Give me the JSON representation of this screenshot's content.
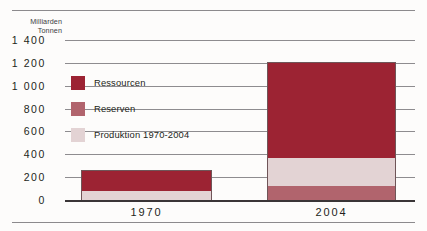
{
  "chart_data": {
    "type": "bar",
    "title": "",
    "subtitle": "",
    "stacked": true,
    "xlabel": "",
    "ylabel": "Milliarden\nTonnen",
    "ylim": [
      0,
      1400
    ],
    "ytick_step": 200,
    "yticks": [
      "0",
      "200",
      "400",
      "600",
      "800",
      "1 000",
      "1 200",
      "1 400"
    ],
    "ytick_values": [
      0,
      200,
      400,
      600,
      800,
      1000,
      1200,
      1400
    ],
    "categories": [
      "1970",
      "2004"
    ],
    "grid": "horizontal",
    "legend_position": "inside-upper-left",
    "series": [
      {
        "name": "Produktion 1970-2004",
        "color": "#e3d3d4",
        "values": [
          80,
          245
        ]
      },
      {
        "name": "Reserven",
        "color": "#b1646d",
        "values": [
          0,
          120
        ]
      },
      {
        "name": "Ressourcen",
        "color": "#9c2333",
        "values": [
          185,
          840
        ]
      }
    ],
    "stack_order_bottom_to_top": [
      "Reserven",
      "Produktion 1970-2004",
      "Ressourcen"
    ],
    "bar_totals": [
      265,
      1205
    ],
    "segment_boundaries": {
      "1970": [
        0,
        0,
        80,
        265
      ],
      "2004": [
        0,
        120,
        365,
        1205
      ]
    }
  },
  "legend": {
    "items": [
      {
        "label": "Ressourcen",
        "color": "#9c2333"
      },
      {
        "label": "Reserven",
        "color": "#b1646d"
      },
      {
        "label": "Produktion 1970-2004",
        "color": "#e3d3d4"
      }
    ]
  },
  "axis": {
    "y_title": "Milliarden\nTonnen"
  },
  "colors": {
    "ressourcen": "#9c2333",
    "reserven": "#b1646d",
    "produktion": "#e3d3d4",
    "gridline": "#8e8c8f",
    "baseline": "#3a3537",
    "text": "#231f20",
    "background": "#fdfcfb"
  }
}
